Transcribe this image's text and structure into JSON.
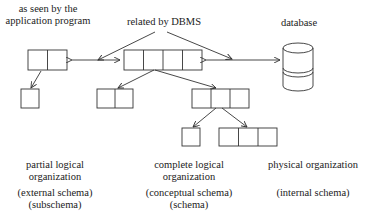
{
  "labels": {
    "app_view_line1": "as seen by the",
    "app_view_line2": "application program",
    "dbms": "related by DBMS",
    "database": "database"
  },
  "columns": [
    {
      "title_line1": "partial logical",
      "title_line2": "organization",
      "schema_line1": "(external schema)",
      "schema_line2": "(subschema)"
    },
    {
      "title_line1": "complete logical",
      "title_line2": "organization",
      "schema_line1": "(conceptual schema)",
      "schema_line2": "(schema)"
    },
    {
      "title_line1": "physical organization",
      "schema_line1": "(internal schema)"
    }
  ],
  "colors": {
    "stroke": "#333333",
    "text": "#222222",
    "background": "#ffffff"
  }
}
